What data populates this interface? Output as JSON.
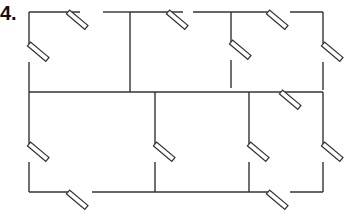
{
  "figure": {
    "label": "4.",
    "colors": {
      "wall": "#333333",
      "background": "#ffffff"
    },
    "walls": [
      [
        29,
        12,
        80,
        12
      ],
      [
        103,
        12,
        130,
        12
      ],
      [
        130,
        12,
        183,
        12
      ],
      [
        193,
        12,
        231,
        12
      ],
      [
        231,
        12,
        268,
        12
      ],
      [
        290,
        12,
        323,
        12
      ],
      [
        29,
        12,
        29,
        44
      ],
      [
        29,
        62,
        29,
        92
      ],
      [
        130,
        12,
        130,
        92
      ],
      [
        231,
        12,
        231,
        42
      ],
      [
        231,
        60,
        231,
        88
      ],
      [
        323,
        12,
        323,
        44
      ],
      [
        323,
        62,
        323,
        90
      ],
      [
        29,
        92,
        323,
        92
      ],
      [
        29,
        92,
        29,
        144
      ],
      [
        29,
        162,
        29,
        192
      ],
      [
        155,
        92,
        155,
        144
      ],
      [
        155,
        162,
        155,
        192
      ],
      [
        249,
        92,
        249,
        144
      ],
      [
        249,
        162,
        249,
        192
      ],
      [
        323,
        92,
        323,
        144
      ],
      [
        323,
        162,
        323,
        192
      ],
      [
        29,
        192,
        68,
        192
      ],
      [
        92,
        192,
        155,
        192
      ],
      [
        155,
        192,
        268,
        192
      ],
      [
        290,
        192,
        323,
        192
      ]
    ],
    "doors": [
      {
        "x": 68,
        "y": 12
      },
      {
        "x": 168,
        "y": 12
      },
      {
        "x": 268,
        "y": 12
      },
      {
        "x": 29,
        "y": 44
      },
      {
        "x": 231,
        "y": 42
      },
      {
        "x": 323,
        "y": 44
      },
      {
        "x": 281,
        "y": 92
      },
      {
        "x": 29,
        "y": 144
      },
      {
        "x": 155,
        "y": 144
      },
      {
        "x": 249,
        "y": 144
      },
      {
        "x": 323,
        "y": 144
      },
      {
        "x": 68,
        "y": 192
      },
      {
        "x": 268,
        "y": 192
      }
    ]
  }
}
